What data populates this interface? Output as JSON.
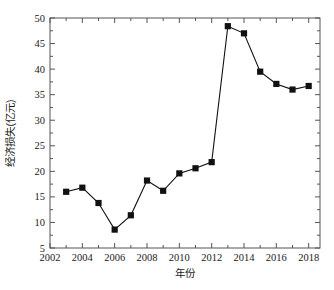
{
  "chart_data": {
    "type": "line",
    "title": "",
    "xlabel": "年份",
    "ylabel": "经济损失(亿元)",
    "x": [
      2003,
      2004,
      2005,
      2006,
      2007,
      2008,
      2009,
      2010,
      2011,
      2012,
      2013,
      2014,
      2015,
      2016,
      2017,
      2018
    ],
    "values": [
      16.0,
      16.8,
      13.8,
      8.6,
      11.4,
      18.2,
      16.2,
      19.6,
      20.6,
      21.8,
      48.4,
      47.0,
      39.5,
      37.1,
      36.0,
      36.7
    ],
    "series": [
      {
        "name": "经济损失(亿元)",
        "values": [
          16.0,
          16.8,
          13.8,
          8.6,
          11.4,
          18.2,
          16.2,
          19.6,
          20.6,
          21.8,
          48.4,
          47.0,
          39.5,
          37.1,
          36.0,
          36.7
        ]
      }
    ],
    "xlim": [
      2002,
      2018.7
    ],
    "ylim": [
      5,
      50
    ],
    "xticks": [
      2002,
      2004,
      2006,
      2008,
      2010,
      2012,
      2014,
      2016,
      2018
    ],
    "xtick_labels": [
      "2002",
      "2004",
      "2006",
      "2008",
      "2010",
      "2012",
      "2014",
      "2016",
      "2018"
    ],
    "yticks": [
      5,
      10,
      15,
      20,
      25,
      30,
      35,
      40,
      45,
      50
    ],
    "ytick_labels": [
      "5",
      "10",
      "15",
      "20",
      "25",
      "30",
      "35",
      "40",
      "45",
      "50"
    ],
    "y_minor_ticks": [
      7.5,
      12.5,
      17.5,
      22.5,
      27.5,
      32.5,
      37.5,
      42.5,
      47.5
    ],
    "x_minor_ticks": [
      2003,
      2005,
      2007,
      2009,
      2011,
      2013,
      2015,
      2017
    ],
    "grid": false,
    "legend": null,
    "marker": "square",
    "line_color": "#111111",
    "marker_color": "#111111",
    "axis_color": "#555555",
    "background_color": "#ffffff"
  }
}
